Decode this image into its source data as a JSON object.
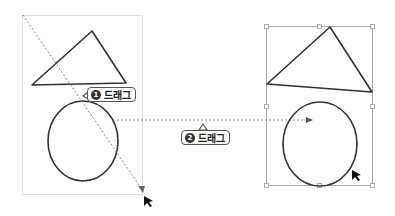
{
  "callouts": [
    {
      "number": "1",
      "label": "드래그"
    },
    {
      "number": "2",
      "label": "드래그"
    }
  ],
  "colors": {
    "stroke": "#333333",
    "dashed": "#888888",
    "selection": "#aaaaaa",
    "handle": "#999999"
  }
}
